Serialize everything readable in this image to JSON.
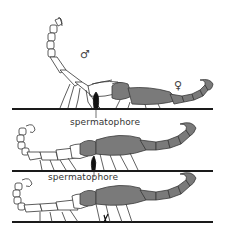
{
  "figure": {
    "colors": {
      "ground": "#1a1a1a",
      "male_fill": "#ffffff",
      "male_outline": "#333333",
      "female_fill": "#7a7a7a",
      "female_outline": "#3a3a3a",
      "spermatophore": "#111111"
    },
    "panels": [
      {
        "id": 1,
        "male_symbol": "♂",
        "female_symbol": "♀",
        "label": "spermatophore"
      },
      {
        "id": 2,
        "label": "spermatophore"
      },
      {
        "id": 3
      }
    ]
  }
}
